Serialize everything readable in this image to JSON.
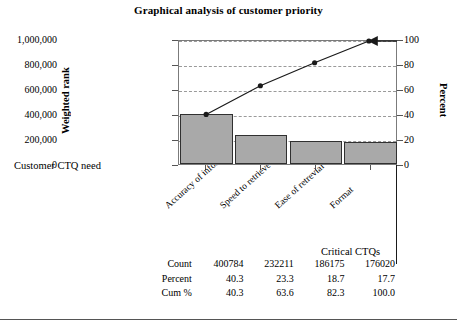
{
  "chart_data": {
    "type": "bar",
    "title": "Graphical analysis of customer priority",
    "categories": [
      "Accuracy of informaton",
      "Speed to retrieve",
      "Ease of retrevial",
      "Format"
    ],
    "values": [
      400784,
      232211,
      186175,
      176020
    ],
    "series": [
      {
        "name": "Count",
        "type": "bar",
        "values": [
          400784,
          232211,
          186175,
          176020
        ]
      },
      {
        "name": "Cum %",
        "type": "line",
        "values": [
          40.3,
          63.6,
          82.3,
          100.0
        ]
      }
    ],
    "percent": [
      40.3,
      23.3,
      18.7,
      17.7
    ],
    "cum_percent": [
      40.3,
      63.6,
      82.3,
      100.0
    ],
    "xlabel": "Customer CTQ need",
    "ylabel": "Weighted rank",
    "y2label": "Percent",
    "ylim": [
      0,
      1000000
    ],
    "y2lim": [
      0,
      100
    ],
    "yticks": [
      "0",
      "200,000",
      "400,000",
      "600,000",
      "800,000",
      "1,000,000"
    ],
    "ytick_values": [
      0,
      200000,
      400000,
      600000,
      800000,
      1000000
    ],
    "y2ticks": [
      "0",
      "20",
      "40",
      "60",
      "80",
      "100"
    ],
    "y2tick_values": [
      0,
      20,
      40,
      60,
      80,
      100
    ],
    "grid": true,
    "legend": "none",
    "bar_color": "#a9a9a9",
    "line_color": "#1a1a1a",
    "annotations": [
      "Customer CTQ need",
      "Critical CTQs"
    ]
  },
  "chart": {
    "title": "Graphical analysis of customer priority",
    "y_axis_title": "Weighted rank",
    "y2_axis_title": "Percent"
  },
  "annotations": {
    "customer_need": "Customer CTQ need",
    "critical_ctqs": "Critical CTQs"
  },
  "table": {
    "rows": [
      {
        "label": "Count",
        "cells": [
          "400784",
          "232211",
          "186175",
          "176020"
        ]
      },
      {
        "label": "Percent",
        "cells": [
          "40.3",
          "23.3",
          "18.7",
          "17.7"
        ]
      },
      {
        "label": "Cum %",
        "cells": [
          "40.3",
          "63.6",
          "82.3",
          "100.0"
        ]
      }
    ]
  }
}
